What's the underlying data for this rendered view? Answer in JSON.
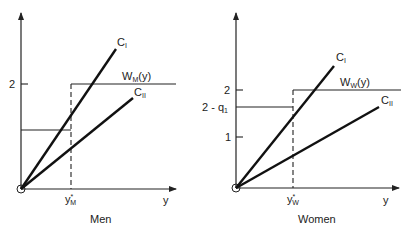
{
  "panels": [
    {
      "caption": "Men",
      "x_axis_label": "y",
      "y_ticks": [
        {
          "label": "2"
        }
      ],
      "threshold_label": {
        "base": "y",
        "sup": "*",
        "sub": "M"
      },
      "wage_label": {
        "base": "W",
        "sub": "M",
        "rest": "(y)"
      },
      "curve_labels": [
        {
          "base": "C",
          "sub": "I"
        },
        {
          "base": "C",
          "sub": "II"
        }
      ]
    },
    {
      "caption": "Women",
      "x_axis_label": "y",
      "y_ticks": [
        {
          "label": "2"
        },
        {
          "label": "2 - q",
          "sub": "1"
        },
        {
          "label": "1"
        }
      ],
      "threshold_label": {
        "base": "y",
        "sup": "*",
        "sub": "W"
      },
      "wage_label": {
        "base": "W",
        "sub": "W",
        "rest": "(y)"
      },
      "curve_labels": [
        {
          "base": "C",
          "sub": "I"
        },
        {
          "base": "C",
          "sub": "II"
        }
      ]
    }
  ]
}
